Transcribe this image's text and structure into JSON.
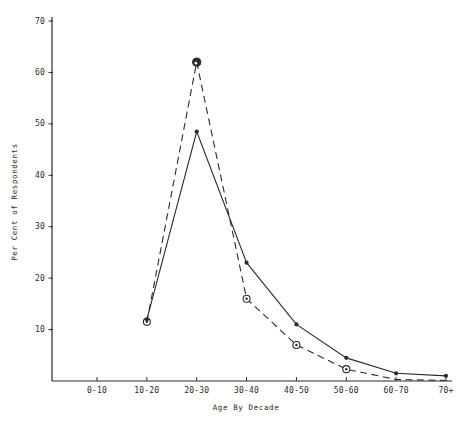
{
  "figure": {
    "background": "#ffffff",
    "ink_color": "#2b2b2b"
  },
  "chart_data": {
    "type": "line",
    "title": "",
    "xlabel": "Age By Decade",
    "ylabel": "Per Cent of Respondents",
    "categories": [
      "0-10",
      "10-20",
      "20-30",
      "30-40",
      "40-50",
      "50-60",
      "60-70",
      "70+"
    ],
    "yticks": [
      10,
      20,
      30,
      40,
      50,
      60,
      70
    ],
    "ylim": [
      0,
      70
    ],
    "grid": false,
    "legend": "none",
    "series": [
      {
        "name": "solid-line-filled-dots",
        "style": "solid",
        "marker": "filled-dot",
        "values": [
          null,
          12,
          48.5,
          23,
          11,
          4.5,
          1.5,
          1
        ],
        "markers": [
          false,
          true,
          true,
          true,
          true,
          true,
          true,
          true
        ]
      },
      {
        "name": "dashed-line-circled-dots",
        "style": "dashed",
        "marker": "open-circle-with-dot",
        "values": [
          null,
          11.5,
          62,
          16,
          7,
          2.3,
          0.3,
          0.1
        ],
        "markers": [
          false,
          true,
          true,
          true,
          true,
          true,
          false,
          false
        ]
      }
    ]
  }
}
